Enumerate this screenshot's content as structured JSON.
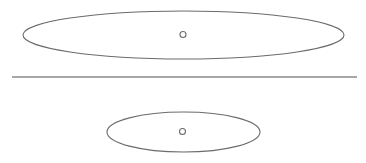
{
  "diagram": {
    "width": 366,
    "height": 163,
    "background": "#ffffff",
    "stroke_color": "#6b6b6b",
    "divider_color": "#8a8a8a",
    "top_ellipse": {
      "cx": 183.5,
      "cy": 35,
      "rx": 160.5,
      "ry": 24
    },
    "top_point": {
      "cx": 183,
      "cy": 34.5,
      "r": 3
    },
    "divider": {
      "x1": 12,
      "y1": 77,
      "x2": 357,
      "y2": 77
    },
    "bottom_ellipse": {
      "cx": 183.5,
      "cy": 132,
      "rx": 76.5,
      "ry": 20
    },
    "bottom_point": {
      "cx": 182.5,
      "cy": 131.5,
      "r": 3
    }
  }
}
